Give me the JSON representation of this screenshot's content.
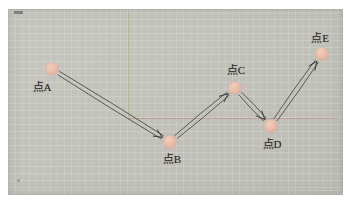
{
  "canvas": {
    "width": 351,
    "height": 204,
    "background_color": "#c3c3bc",
    "border_color": "#ffffff"
  },
  "axes": {
    "vertical": {
      "color": "#b0b078",
      "x": 128,
      "y_top": 12,
      "y_bottom": 119
    },
    "horizontal": {
      "color": "#c4968e",
      "y": 118,
      "x_left": 128,
      "x_right": 338
    }
  },
  "chart_data": {
    "type": "scatter",
    "title": "",
    "xlabel": "",
    "ylabel": "",
    "grid": false,
    "legend": null,
    "point_color": "#e4b9a4",
    "arrow_color": "#3a3a3a",
    "points": [
      {
        "id": "A",
        "label": "点A",
        "x": 52,
        "y": 69,
        "radius": 6.5,
        "label_position": "below-left",
        "label_x": 42,
        "label_y": 87
      },
      {
        "id": "B",
        "label": "点B",
        "x": 170,
        "y": 142,
        "radius": 6.5,
        "label_position": "below",
        "label_x": 172,
        "label_y": 159
      },
      {
        "id": "C",
        "label": "点C",
        "x": 235,
        "y": 88,
        "radius": 6.5,
        "label_position": "above",
        "label_x": 236,
        "label_y": 70
      },
      {
        "id": "D",
        "label": "点D",
        "x": 271,
        "y": 126,
        "radius": 6.5,
        "label_position": "below",
        "label_x": 272,
        "label_y": 144
      },
      {
        "id": "E",
        "label": "点E",
        "x": 322,
        "y": 54,
        "radius": 6.5,
        "label_position": "above",
        "label_x": 320,
        "label_y": 38
      }
    ],
    "arrows": [
      {
        "id": "A-B",
        "from": "A",
        "to": "B",
        "direction": "down-right",
        "style": "double-stroke"
      },
      {
        "id": "B-C",
        "from": "B",
        "to": "C",
        "direction": "up-right",
        "style": "double-stroke"
      },
      {
        "id": "C-D",
        "from": "C",
        "to": "D",
        "direction": "down-right",
        "style": "double-stroke"
      },
      {
        "id": "D-E",
        "from": "D",
        "to": "E",
        "direction": "up-right",
        "style": "double-stroke"
      }
    ]
  }
}
